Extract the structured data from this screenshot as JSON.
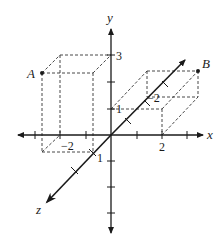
{
  "diagram": {
    "axes": {
      "x": {
        "label": "x"
      },
      "y": {
        "label": "y"
      },
      "z": {
        "label": "z"
      }
    },
    "tick_labels": {
      "y_3": "3",
      "y_1": "1",
      "x_2": "2",
      "z_neg2_back": "−2",
      "x_neg2": "−2",
      "z_1": "1"
    },
    "points": [
      {
        "name": "A",
        "label": "A",
        "coords": [
          -2,
          3,
          1
        ]
      },
      {
        "name": "B",
        "label": "B",
        "coords": [
          2,
          1,
          -2
        ]
      }
    ],
    "colors": {
      "ink": "#1a1a1a",
      "background": "#ffffff"
    }
  }
}
